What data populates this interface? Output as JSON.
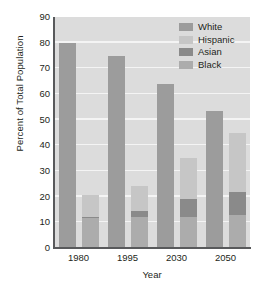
{
  "chart_data": {
    "type": "bar",
    "title": "",
    "subtitle": "",
    "xlabel": "Year",
    "ylabel": "Percent of Total Population",
    "categories": [
      "1980",
      "1995",
      "2030",
      "2050"
    ],
    "ylim": [
      0,
      90
    ],
    "yticks": [
      0,
      10,
      20,
      30,
      40,
      50,
      60,
      70,
      80,
      90
    ],
    "ytick_labels": [
      "0",
      "10",
      "20",
      "30",
      "40",
      "50",
      "60",
      "70",
      "80",
      "90"
    ],
    "grid": "horizontal",
    "legend_position": "top-right",
    "legend": [
      "White",
      "Hispanic",
      "Asian",
      "Black"
    ],
    "series": [
      {
        "name": "White",
        "values": [
          80,
          75,
          64,
          53.5
        ],
        "color": "#9c9c9c",
        "stacked": false
      },
      {
        "name": "Hispanic",
        "values": [
          8.5,
          9.5,
          16,
          23
        ],
        "color": "#c6c6c6",
        "stacked": true
      },
      {
        "name": "Asian",
        "values": [
          0.5,
          2.5,
          7,
          9
        ],
        "color": "#8a8a8a",
        "stacked": true
      },
      {
        "name": "Black",
        "values": [
          11.5,
          12,
          12,
          13
        ],
        "color": "#acacac",
        "stacked": true
      }
    ],
    "stacked_bar_totals": [
      20.5,
      24,
      35,
      45
    ],
    "plot_background": "#dcdcdc",
    "gridline_color": "#f4f4f4",
    "axis_color": "#58595b",
    "text_color": "#231f20"
  },
  "legend_items": [
    {
      "label": "White",
      "color": "#9c9c9c"
    },
    {
      "label": "Hispanic",
      "color": "#c6c6c6"
    },
    {
      "label": "Asian",
      "color": "#8a8a8a"
    },
    {
      "label": "Black",
      "color": "#acacac"
    }
  ]
}
